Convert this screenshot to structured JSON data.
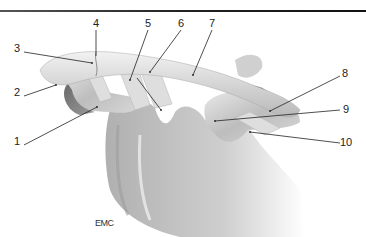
{
  "figure": {
    "type": "anatomical-illustration",
    "credit": "EMC",
    "labels": [
      {
        "id": "1",
        "text": "1",
        "x": 14,
        "y": 141
      },
      {
        "id": "2",
        "text": "2",
        "x": 14,
        "y": 92
      },
      {
        "id": "3",
        "text": "3",
        "x": 14,
        "y": 48
      },
      {
        "id": "4",
        "text": "4",
        "x": 93,
        "y": 20
      },
      {
        "id": "5",
        "text": "5",
        "x": 145,
        "y": 20
      },
      {
        "id": "6",
        "text": "6",
        "x": 178,
        "y": 20
      },
      {
        "id": "7",
        "text": "7",
        "x": 209,
        "y": 20
      },
      {
        "id": "8",
        "text": "8",
        "x": 342,
        "y": 70
      },
      {
        "id": "9",
        "text": "9",
        "x": 343,
        "y": 107
      },
      {
        "id": "10",
        "text": "10",
        "x": 343,
        "y": 139
      }
    ]
  }
}
